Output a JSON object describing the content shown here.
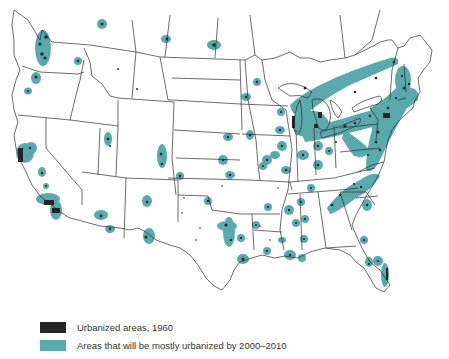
{
  "map": {
    "region": "Contiguous United States",
    "colors": {
      "urbanized_1960": "#262626",
      "urbanized_2000_2010": "#5aa9ad",
      "borders": "#2b2b2b",
      "background": "#ffffff"
    }
  },
  "legend": {
    "items": [
      {
        "label": "Urbanized areas, 1960",
        "color": "#262626"
      },
      {
        "label": "Areas that will be mostly urbanized by 2000–2010",
        "color": "#5aa9ad"
      }
    ]
  }
}
